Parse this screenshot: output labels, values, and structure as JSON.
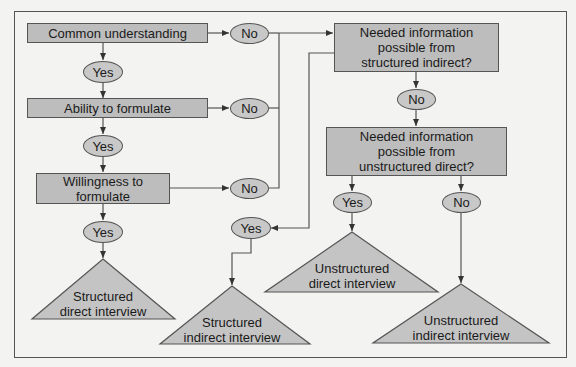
{
  "diagram": {
    "type": "flowchart",
    "colors": {
      "background": "#f3f3f1",
      "box_fill": "#bdbdbd",
      "oval_fill": "#c8c8c8",
      "stroke": "#555555"
    },
    "decisions": {
      "common_understanding": "Common understanding",
      "ability_to_formulate": "Ability to formulate",
      "willingness_line1": "Willingness to",
      "willingness_line2": "formulate",
      "structured_indirect_line1": "Needed information",
      "structured_indirect_line2": "possible from",
      "structured_indirect_line3": "structured indirect?",
      "unstructured_direct_line1": "Needed information",
      "unstructured_direct_line2": "possible from",
      "unstructured_direct_line3": "unstructured direct?"
    },
    "answers": {
      "yes": "Yes",
      "no": "No"
    },
    "outcomes": {
      "structured_direct_line1": "Structured",
      "structured_direct_line2": "direct interview",
      "structured_indirect_line1": "Structured",
      "structured_indirect_line2": "indirect interview",
      "unstructured_direct_line1": "Unstructured",
      "unstructured_direct_line2": "direct interview",
      "unstructured_indirect_line1": "Unstructured",
      "unstructured_indirect_line2": "indirect interview"
    }
  }
}
